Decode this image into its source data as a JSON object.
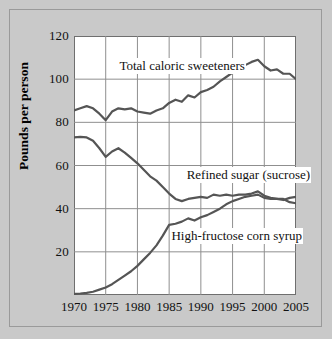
{
  "chart_data": {
    "type": "line",
    "title": "",
    "xlabel": "",
    "ylabel": "Pounds per person",
    "xlim": [
      1970,
      2005
    ],
    "ylim": [
      0,
      120
    ],
    "xticks": [
      1970,
      1975,
      1980,
      1985,
      1990,
      1995,
      2000,
      2005
    ],
    "yticks": [
      20,
      40,
      60,
      80,
      100,
      120
    ],
    "grid": true,
    "legend_position": "inline-annotations",
    "x": [
      1970,
      1971,
      1972,
      1973,
      1974,
      1975,
      1976,
      1977,
      1978,
      1979,
      1980,
      1981,
      1982,
      1983,
      1984,
      1985,
      1986,
      1987,
      1988,
      1989,
      1990,
      1991,
      1992,
      1993,
      1994,
      1995,
      1996,
      1997,
      1998,
      1999,
      2000,
      2001,
      2002,
      2003,
      2004,
      2005
    ],
    "series": [
      {
        "name": "Total caloric sweeteners",
        "color": "#555555",
        "values": [
          85.5,
          86.5,
          87.5,
          86.5,
          84.0,
          81.0,
          85.0,
          86.5,
          86.0,
          86.5,
          85.0,
          84.5,
          84.0,
          85.5,
          86.5,
          89.0,
          90.5,
          89.5,
          92.5,
          91.5,
          94.0,
          95.0,
          96.5,
          99.0,
          101.0,
          103.0,
          105.0,
          106.5,
          108.0,
          109.0,
          106.0,
          104.0,
          104.5,
          102.5,
          102.5,
          100.0
        ]
      },
      {
        "name": "Refined sugar (sucrose)",
        "color": "#555555",
        "values": [
          73.0,
          73.3,
          73.0,
          71.5,
          68.0,
          64.0,
          66.5,
          68.0,
          66.0,
          63.5,
          61.0,
          58.0,
          55.0,
          53.0,
          50.0,
          47.0,
          44.5,
          43.5,
          44.5,
          45.0,
          45.5,
          45.0,
          46.5,
          46.0,
          46.5,
          46.0,
          46.5,
          46.5,
          47.0,
          48.0,
          46.0,
          45.0,
          44.5,
          44.5,
          43.0,
          42.5
        ]
      },
      {
        "name": "High-fructose corn syrup",
        "color": "#555555",
        "values": [
          0.5,
          0.7,
          1.0,
          1.5,
          2.5,
          3.5,
          5.0,
          7.0,
          9.0,
          11.0,
          13.5,
          16.5,
          19.5,
          23.0,
          27.5,
          32.5,
          33.0,
          34.0,
          35.5,
          34.5,
          36.0,
          37.0,
          38.5,
          40.0,
          42.0,
          43.5,
          44.5,
          45.5,
          46.0,
          46.5,
          45.0,
          44.5,
          44.5,
          44.0,
          45.0,
          45.5
        ]
      }
    ],
    "annotations": [
      {
        "text": "Total caloric sweeteners",
        "x": 1977.0,
        "y": 105.5
      },
      {
        "text": "Refined sugar (sucrose)",
        "x": 1987.6,
        "y": 55.0
      },
      {
        "text": "High-fructose corn syrup",
        "x": 1985.2,
        "y": 27.0
      }
    ]
  },
  "axes": {
    "ylabel": "Pounds per person",
    "ytick_labels": [
      "120",
      "100",
      "80",
      "60",
      "40",
      "20"
    ],
    "xtick_labels": [
      "1970",
      "1975",
      "1980",
      "1985",
      "1990",
      "1995",
      "2000",
      "2005"
    ]
  },
  "colors": {
    "background": "#c9c9c9",
    "plot_background": "#ffffff",
    "line": "#555555",
    "grid": "#8f8f8f",
    "axis": "#6f6f6f",
    "frame_border": "#9a9a9a",
    "text": "#111111"
  }
}
